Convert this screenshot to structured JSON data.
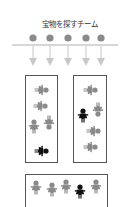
{
  "title": "宝物を探すチーム",
  "colors": {
    "gray": "#8a8a8a",
    "light_gray": "#c8c8c8",
    "black": "#111111",
    "line": "#9a9a9a",
    "box_border": "#555555"
  },
  "team_dots": [
    {
      "x": 33,
      "label": "member-1"
    },
    {
      "x": 50,
      "label": "member-2"
    },
    {
      "x": 68,
      "label": "member-3"
    },
    {
      "x": 86,
      "label": "member-4"
    },
    {
      "x": 101,
      "label": "member-5"
    }
  ],
  "groups": [
    {
      "name": "group-left",
      "figures": [
        {
          "x": 41,
          "y": 90,
          "rot": 90,
          "color": "gray"
        },
        {
          "x": 40,
          "y": 106,
          "rot": 90,
          "color": "gray"
        },
        {
          "x": 34,
          "y": 127,
          "rot": 0,
          "color": "gray"
        },
        {
          "x": 49,
          "y": 122,
          "rot": 180,
          "color": "gray"
        },
        {
          "x": 41,
          "y": 151,
          "rot": 90,
          "color": "black"
        }
      ]
    },
    {
      "name": "group-right",
      "figures": [
        {
          "x": 90,
          "y": 90,
          "rot": 90,
          "color": "gray"
        },
        {
          "x": 83,
          "y": 116,
          "rot": 0,
          "color": "black"
        },
        {
          "x": 98,
          "y": 109,
          "rot": 180,
          "color": "gray"
        },
        {
          "x": 93,
          "y": 131,
          "rot": 90,
          "color": "gray"
        },
        {
          "x": 90,
          "y": 147,
          "rot": 90,
          "color": "gray"
        }
      ]
    },
    {
      "name": "group-bottom",
      "figures": [
        {
          "x": 36,
          "y": 188,
          "rot": 0,
          "color": "gray"
        },
        {
          "x": 52,
          "y": 190,
          "rot": 0,
          "color": "gray"
        },
        {
          "x": 66,
          "y": 187,
          "rot": 0,
          "color": "gray"
        },
        {
          "x": 80,
          "y": 192,
          "rot": 0,
          "color": "black"
        },
        {
          "x": 96,
          "y": 187,
          "rot": 0,
          "color": "gray"
        }
      ]
    }
  ]
}
